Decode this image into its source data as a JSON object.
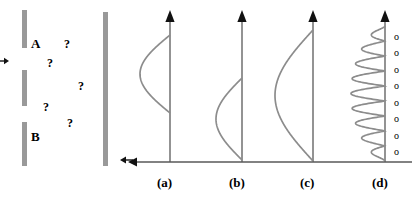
{
  "figure": {
    "width": 416,
    "height": 198,
    "background": "#ffffff",
    "barrier_color": "#999999",
    "curve_color": "#8c8c8c",
    "axis_color": "#595959",
    "text_color": "#000000"
  },
  "left_diagram": {
    "name": "double-slit-barrier-diagram",
    "incoming_arrow": {
      "x1": 0,
      "y1": 61,
      "x2": 9,
      "y2": 61
    },
    "barrier_segments": [
      {
        "name": "barrier-top",
        "x": 22,
        "y": 10,
        "w": 5,
        "h": 38
      },
      {
        "name": "barrier-middle",
        "x": 22,
        "y": 70,
        "w": 5,
        "h": 36
      },
      {
        "name": "barrier-bottom",
        "x": 22,
        "y": 122,
        "w": 5,
        "h": 44
      }
    ],
    "screen_bar": {
      "name": "detection-screen",
      "x": 103,
      "y": 12,
      "w": 5,
      "h": 154
    },
    "exit_arrow": {
      "x1": 133,
      "y1": 160,
      "x2": 120,
      "y2": 160
    },
    "slit_labels": [
      {
        "text": "A",
        "x": 31,
        "y": 37
      },
      {
        "text": "B",
        "x": 31,
        "y": 130
      }
    ],
    "question_marks": [
      {
        "text": "?",
        "x": 64,
        "y": 38
      },
      {
        "text": "?",
        "x": 47,
        "y": 57
      },
      {
        "text": "?",
        "x": 78,
        "y": 80
      },
      {
        "text": "?",
        "x": 43,
        "y": 101
      },
      {
        "text": "?",
        "x": 67,
        "y": 117
      }
    ]
  },
  "chart_data": {
    "type": "line",
    "title": "",
    "xlabel": "",
    "ylabel": "",
    "grid": false,
    "legend": null,
    "shared_axis": {
      "name": "horizontal-baseline-axis",
      "y": 162,
      "x_start": 412,
      "x_end": 128,
      "arrow_direction": "left"
    },
    "panels": [
      {
        "label": "(a)",
        "label_x": 170,
        "label_y": 176,
        "axis_x": 170,
        "axis_top": 10,
        "axis_bottom": 162,
        "curve_kind": "single-lobe-half-wave",
        "curve_top_y": 35,
        "curve_bottom_y": 113,
        "lobe_amplitude": 30,
        "lobe_direction": "left",
        "node_count": 0,
        "node_markers": []
      },
      {
        "label": "(b)",
        "label_x": 242,
        "label_y": 176,
        "axis_x": 242,
        "axis_top": 10,
        "axis_bottom": 162,
        "curve_kind": "single-lobe-half-wave",
        "curve_top_y": 78,
        "curve_bottom_y": 160,
        "lobe_amplitude": 26,
        "lobe_direction": "left",
        "node_count": 0,
        "node_markers": []
      },
      {
        "label": "(c)",
        "label_x": 313,
        "label_y": 176,
        "axis_x": 313,
        "axis_top": 10,
        "axis_bottom": 162,
        "curve_kind": "single-lobe-half-wave",
        "curve_top_y": 30,
        "curve_bottom_y": 161,
        "lobe_amplitude": 38,
        "lobe_direction": "left",
        "node_count": 0,
        "node_markers": []
      },
      {
        "label": "(d)",
        "label_x": 385,
        "label_y": 176,
        "axis_x": 385,
        "axis_top": 10,
        "axis_bottom": 162,
        "curve_kind": "oscillatory-envelope",
        "curve_top_y": 26,
        "curve_bottom_y": 161,
        "lobe_amplitude": 34,
        "lobe_direction": "left",
        "oscillation_count": 9,
        "node_count": 8,
        "node_symbol": "o",
        "node_markers": [
          {
            "symbol": "o",
            "x": 394,
            "y": 32
          },
          {
            "symbol": "o",
            "x": 394,
            "y": 48
          },
          {
            "symbol": "o",
            "x": 394,
            "y": 65
          },
          {
            "symbol": "o",
            "x": 394,
            "y": 81
          },
          {
            "symbol": "o",
            "x": 394,
            "y": 98
          },
          {
            "symbol": "o",
            "x": 394,
            "y": 114
          },
          {
            "symbol": "o",
            "x": 394,
            "y": 131
          },
          {
            "symbol": "o",
            "x": 394,
            "y": 147
          }
        ]
      }
    ]
  }
}
